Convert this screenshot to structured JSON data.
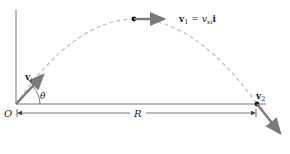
{
  "diagram": {
    "colors": {
      "axis": "#555555",
      "trajectory": "#bbbbbb",
      "vector": "#7a7a7a",
      "point": "#111111",
      "text": "#222222"
    },
    "labels": {
      "origin": "O",
      "angle": "θ",
      "range": "R",
      "initial_velocity": {
        "bold": "v",
        "sub": "i"
      },
      "top_velocity": {
        "bold": "v",
        "sub": "1",
        "equals": " = ",
        "rhs_italic": "v",
        "rhs_sub": "xi",
        "unit_vector": "i"
      },
      "final_velocity": {
        "bold": "v",
        "sub": "2"
      }
    },
    "points": {
      "origin": [
        16,
        104
      ],
      "peak": [
        134,
        19
      ],
      "landing": [
        257,
        104
      ]
    }
  }
}
